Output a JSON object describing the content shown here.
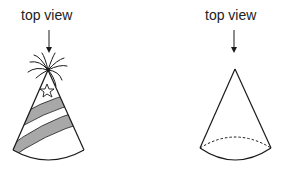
{
  "figures": [
    {
      "name": "party-hat",
      "label": "top view",
      "has_decorations": true
    },
    {
      "name": "plain-cone",
      "label": "top view",
      "has_decorations": false
    }
  ],
  "colors": {
    "stroke": "#1a1a1a",
    "stripe_fill": "#a8a8a8",
    "background": "#ffffff"
  }
}
